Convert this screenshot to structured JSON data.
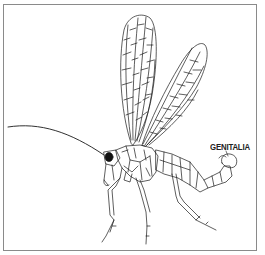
{
  "figure": {
    "labels": [
      {
        "id": "genitalia",
        "text": "GENITALIA"
      }
    ],
    "colors": {
      "line": "#1a1a1a",
      "frame": "#8a8a8a",
      "background": "#ffffff"
    }
  }
}
